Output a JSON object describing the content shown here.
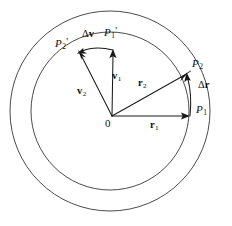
{
  "figure": {
    "background_color": "#ffffff",
    "stroke_color": "#1a1a1a",
    "width": 232,
    "height": 226
  },
  "circles": {
    "outer": {
      "cx": 110,
      "cy": 111,
      "r": 100,
      "label": "outer-circle"
    },
    "inner": {
      "cx": 110,
      "cy": 111,
      "r": 79,
      "label": "inner-circle"
    }
  },
  "origin": {
    "label": "0",
    "x": 112,
    "y": 116
  },
  "points": [
    {
      "name": "P1",
      "base": "P",
      "sub": "1",
      "prime": "",
      "label_x": 196,
      "label_y": 110
    },
    {
      "name": "P2",
      "base": "P",
      "sub": "2",
      "prime": "",
      "label_x": 192,
      "label_y": 60
    },
    {
      "name": "P1p",
      "base": "P",
      "sub": "1",
      "prime": "'",
      "label_x": 106,
      "label_y": 27
    },
    {
      "name": "P2p",
      "base": "P",
      "sub": "2",
      "prime": "'",
      "label_x": 57,
      "label_y": 38
    }
  ],
  "vectors": [
    {
      "name": "r1",
      "base": "r",
      "sub": "1",
      "greek": "",
      "bold": true,
      "label_x": 152,
      "label_y": 120
    },
    {
      "name": "r2",
      "base": "r",
      "sub": "2",
      "greek": "",
      "bold": true,
      "label_x": 140,
      "label_y": 80
    },
    {
      "name": "v1",
      "base": "v",
      "sub": "1",
      "greek": "",
      "bold": true,
      "label_x": 113,
      "label_y": 73
    },
    {
      "name": "v2",
      "base": "v",
      "sub": "2",
      "greek": "",
      "bold": true,
      "label_x": 79,
      "label_y": 88
    },
    {
      "name": "dr",
      "base": "r",
      "sub": "",
      "greek": "Δ",
      "bold": true,
      "label_x": 200,
      "label_y": 82
    },
    {
      "name": "dv",
      "base": "v",
      "sub": "",
      "greek": "Δ",
      "bold": true,
      "label_x": 84,
      "label_y": 30
    }
  ],
  "label_texts": {
    "origin": "0",
    "P1": "P",
    "P2": "P",
    "P1p": "P",
    "P2p": "P",
    "r1": "r",
    "r2": "r",
    "v1": "v",
    "v2": "v",
    "delta_r": "r",
    "delta_v": "v",
    "delta_symbol": "Δ",
    "sub_1": "1",
    "sub_2": "2",
    "prime_mark": "'"
  }
}
